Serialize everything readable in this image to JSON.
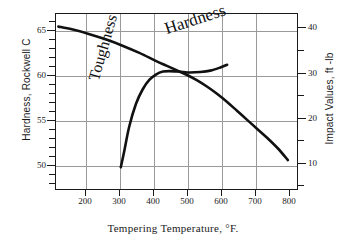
{
  "chart_data": {
    "type": "line",
    "title": "",
    "xlabel": "Tempering  Temperature,  °F.",
    "ylabel": "Hardness,  Rockwell  C",
    "y2label": "Impact  Values,  ft -lb",
    "xlim": [
      100,
      820
    ],
    "ylim": [
      47.5,
      67
    ],
    "y2lim": [
      5,
      44
    ],
    "grid": true,
    "legend_position": "inline-annotations",
    "xticks": [
      200,
      300,
      400,
      500,
      600,
      700,
      800
    ],
    "xtick_labels": [
      "200",
      "300",
      "400",
      "500",
      "600",
      "700",
      "800"
    ],
    "yticks": [
      50,
      55,
      60,
      65
    ],
    "ytick_labels": [
      "50",
      "55",
      "60",
      "65"
    ],
    "y2ticks": [
      10,
      20,
      30,
      40
    ],
    "y2tick_labels": [
      "10",
      "20",
      "30",
      "40"
    ],
    "series": [
      {
        "name": "Hardness",
        "axis": "left",
        "units": "Rockwell C",
        "annotation": "Hardness",
        "x": [
          110,
          150,
          200,
          250,
          300,
          350,
          400,
          430,
          460,
          490,
          520,
          550,
          580,
          610,
          640,
          670,
          700,
          730,
          760,
          790
        ],
        "values": [
          65.5,
          65.2,
          64.7,
          64.1,
          63.4,
          62.6,
          61.7,
          61.2,
          60.7,
          60.2,
          59.6,
          58.9,
          58.1,
          57.2,
          56.2,
          55.2,
          54.2,
          53.2,
          52.1,
          50.8
        ]
      },
      {
        "name": "Toughness",
        "axis": "right",
        "units": "ft-lb",
        "annotation": "Toughness",
        "x": [
          295,
          305,
          320,
          340,
          360,
          380,
          400,
          420,
          440,
          460,
          480,
          500,
          530,
          560,
          590,
          610
        ],
        "values": [
          10.0,
          13.5,
          19.0,
          24.0,
          27.2,
          29.3,
          30.5,
          31.1,
          31.2,
          31.1,
          31.0,
          30.9,
          31.0,
          31.3,
          32.0,
          32.6
        ]
      }
    ]
  },
  "annotations": {
    "hardness": "Hardness",
    "toughness": "Toughness"
  },
  "axes": {
    "left_title": "Hardness,  Rockwell  C",
    "right_title": "Impact  Values,  ft -lb",
    "bottom_title": "Tempering  Temperature,  °F."
  },
  "colors": {
    "curve": "#111111",
    "frame": "#1a1a1a",
    "grid": "#9a9a9a",
    "background": "#ffffff"
  }
}
